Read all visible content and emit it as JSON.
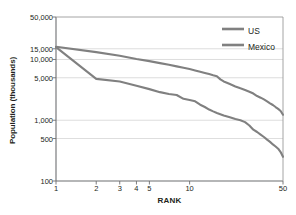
{
  "chart_data": {
    "type": "line",
    "title": "",
    "subtitle": "",
    "xlabel": "RANK",
    "ylabel": "Population (thousands)",
    "xscale": "log",
    "yscale": "log",
    "xlim": [
      1,
      50
    ],
    "ylim": [
      100,
      50000
    ],
    "grid": true,
    "legend_position": "top-right",
    "x_ticks": [
      {
        "value": 1,
        "label": "1"
      },
      {
        "value": 2,
        "label": "2"
      },
      {
        "value": 3,
        "label": "3"
      },
      {
        "value": 4,
        "label": "4"
      },
      {
        "value": 5,
        "label": "5"
      },
      {
        "value": 10,
        "label": "10"
      },
      {
        "value": 50,
        "label": "50"
      }
    ],
    "y_ticks": [
      {
        "value": 50000,
        "label": "50,000"
      },
      {
        "value": 15000,
        "label": "15,000"
      },
      {
        "value": 10000,
        "label": "10,000"
      },
      {
        "value": 5000,
        "label": "5,000"
      },
      {
        "value": 1000,
        "label": "1,000"
      },
      {
        "value": 500,
        "label": "500"
      },
      {
        "value": 100,
        "label": "100"
      }
    ],
    "series": [
      {
        "name": "US",
        "color": "#808080",
        "x": [
          1,
          2,
          3,
          4,
          5,
          6,
          7,
          8,
          9,
          10,
          11,
          12,
          13,
          14,
          15,
          16,
          17,
          18,
          19,
          20,
          22,
          24,
          26,
          28,
          30,
          32,
          34,
          36,
          38,
          40,
          42,
          44,
          46,
          48,
          50
        ],
        "y": [
          16200,
          13200,
          11500,
          10200,
          9400,
          8700,
          8200,
          7700,
          7300,
          6950,
          6600,
          6300,
          6000,
          5750,
          5500,
          5300,
          4700,
          4350,
          4150,
          3950,
          3600,
          3350,
          3150,
          2950,
          2750,
          2500,
          2350,
          2200,
          2050,
          1900,
          1780,
          1650,
          1540,
          1420,
          1230
        ]
      },
      {
        "name": "Mexico",
        "color": "#808080",
        "x": [
          1,
          2,
          3,
          4,
          5,
          6,
          7,
          8,
          9,
          10,
          11,
          12,
          13,
          14,
          15,
          16,
          18,
          20,
          22,
          24,
          26,
          28,
          30,
          32,
          34,
          36,
          38,
          40,
          42,
          44,
          46,
          48,
          50
        ],
        "y": [
          16000,
          4800,
          4350,
          3700,
          3250,
          2900,
          2700,
          2600,
          2250,
          2150,
          2050,
          1800,
          1650,
          1500,
          1400,
          1320,
          1200,
          1120,
          1050,
          1000,
          930,
          820,
          700,
          640,
          580,
          530,
          480,
          440,
          400,
          370,
          340,
          300,
          250
        ]
      }
    ]
  },
  "legend": {
    "entries": [
      {
        "label": "US"
      },
      {
        "label": "Mexico"
      }
    ]
  }
}
